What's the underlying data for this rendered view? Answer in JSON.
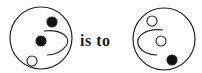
{
  "diagram": {
    "type": "visual-analogy",
    "connector_text": "is to",
    "stroke_color": "#222222",
    "fill_black": "#111111",
    "fill_white": "#ffffff",
    "figures": [
      {
        "name": "figure-a",
        "outer_circle": {
          "cx": 41,
          "cy": 38,
          "r": 31
        },
        "curve": {
          "path": "M44,31 C62,29 72,38 66,46 C62,52 54,55 47,55",
          "opens": "left"
        },
        "dots": [
          {
            "cx": 52,
            "cy": 22,
            "r": 5,
            "fill": "black",
            "position": "top-right"
          },
          {
            "cx": 41,
            "cy": 41,
            "r": 5,
            "fill": "black",
            "position": "center"
          },
          {
            "cx": 32,
            "cy": 61,
            "r": 5,
            "fill": "white",
            "position": "bottom-left"
          }
        ]
      },
      {
        "name": "figure-b",
        "outer_circle": {
          "cx": 164,
          "cy": 39,
          "r": 31
        },
        "curve": {
          "path": "M163,30 C146,28 136,36 138,44 C140,52 150,55 157,55",
          "opens": "right"
        },
        "dots": [
          {
            "cx": 152,
            "cy": 21,
            "r": 5,
            "fill": "white",
            "position": "top"
          },
          {
            "cx": 161,
            "cy": 41,
            "r": 5,
            "fill": "white",
            "position": "center"
          },
          {
            "cx": 172,
            "cy": 60,
            "r": 5,
            "fill": "black",
            "position": "bottom-right"
          }
        ]
      }
    ]
  }
}
